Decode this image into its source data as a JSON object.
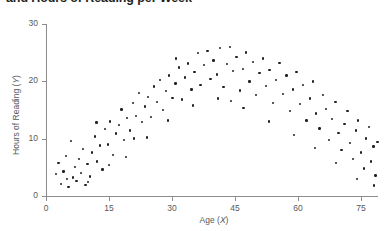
{
  "chart_data": {
    "type": "scatter",
    "title": "and Hours of Reading per Week",
    "xlabel": "Age (X)",
    "ylabel": "Hours of Reading (Y)",
    "xlim": [
      0,
      79
    ],
    "ylim": [
      0,
      30
    ],
    "xticks": [
      0,
      15,
      30,
      45,
      60,
      75
    ],
    "yticks": [
      0,
      10,
      20,
      30
    ],
    "xtick_labels": [
      "0",
      "15",
      "30",
      "45",
      "60",
      "75"
    ],
    "ytick_labels": [
      "0",
      "10",
      "20",
      "30"
    ],
    "grid": false,
    "legend": null,
    "marker_color": "#231f20",
    "axis_color": "#8c8c8c",
    "relationship": "inverted-U quadratic: reading hours rise with age to a peak near age 38-42 then decline",
    "points": [
      [
        3.0,
        5.8
      ],
      [
        3.6,
        2.1
      ],
      [
        4.2,
        4.3
      ],
      [
        4.8,
        7.0
      ],
      [
        5.4,
        1.6
      ],
      [
        6.0,
        9.6
      ],
      [
        6.4,
        3.2
      ],
      [
        6.9,
        5.1
      ],
      [
        7.3,
        2.6
      ],
      [
        7.8,
        6.4
      ],
      [
        8.3,
        4.0
      ],
      [
        8.8,
        8.2
      ],
      [
        9.4,
        1.9
      ],
      [
        9.9,
        5.6
      ],
      [
        10.4,
        3.4
      ],
      [
        11.0,
        7.6
      ],
      [
        11.6,
        10.4
      ],
      [
        12.2,
        6.0
      ],
      [
        12.8,
        8.8
      ],
      [
        13.4,
        4.6
      ],
      [
        14.0,
        11.7
      ],
      [
        14.7,
        9.0
      ],
      [
        15.3,
        13.0
      ],
      [
        16.0,
        7.2
      ],
      [
        16.6,
        10.9
      ],
      [
        17.3,
        12.4
      ],
      [
        18.0,
        15.1
      ],
      [
        18.6,
        9.8
      ],
      [
        19.3,
        13.6
      ],
      [
        20.0,
        11.4
      ],
      [
        20.7,
        16.2
      ],
      [
        21.4,
        14.0
      ],
      [
        22.1,
        18.0
      ],
      [
        22.8,
        12.9
      ],
      [
        23.5,
        15.6
      ],
      [
        24.2,
        17.3
      ],
      [
        25.0,
        13.8
      ],
      [
        25.7,
        19.1
      ],
      [
        26.4,
        16.4
      ],
      [
        27.1,
        20.2
      ],
      [
        27.9,
        15.0
      ],
      [
        28.6,
        18.3
      ],
      [
        29.3,
        21.0
      ],
      [
        30.1,
        17.1
      ],
      [
        30.8,
        19.6
      ],
      [
        31.6,
        22.4
      ],
      [
        32.3,
        16.8
      ],
      [
        33.1,
        20.7
      ],
      [
        33.8,
        23.1
      ],
      [
        34.6,
        18.6
      ],
      [
        35.3,
        21.6
      ],
      [
        36.1,
        24.9
      ],
      [
        36.8,
        19.4
      ],
      [
        37.6,
        22.8
      ],
      [
        38.4,
        25.3
      ],
      [
        39.1,
        20.4
      ],
      [
        39.9,
        23.6
      ],
      [
        40.7,
        21.2
      ],
      [
        41.4,
        25.8
      ],
      [
        42.2,
        19.0
      ],
      [
        43.0,
        23.0
      ],
      [
        43.8,
        26.0
      ],
      [
        44.5,
        21.8
      ],
      [
        45.3,
        24.2
      ],
      [
        46.1,
        18.4
      ],
      [
        46.9,
        22.2
      ],
      [
        47.6,
        25.0
      ],
      [
        48.4,
        20.0
      ],
      [
        49.2,
        23.4
      ],
      [
        50.0,
        17.6
      ],
      [
        50.8,
        21.4
      ],
      [
        51.6,
        24.0
      ],
      [
        52.4,
        19.2
      ],
      [
        53.2,
        22.0
      ],
      [
        54.0,
        16.2
      ],
      [
        54.8,
        20.2
      ],
      [
        55.6,
        23.2
      ],
      [
        56.4,
        17.8
      ],
      [
        57.2,
        21.0
      ],
      [
        58.0,
        14.8
      ],
      [
        58.8,
        18.6
      ],
      [
        59.6,
        21.6
      ],
      [
        60.4,
        16.0
      ],
      [
        61.2,
        19.4
      ],
      [
        62.0,
        13.2
      ],
      [
        62.8,
        17.0
      ],
      [
        63.5,
        20.0
      ],
      [
        64.3,
        14.4
      ],
      [
        65.1,
        11.8
      ],
      [
        65.9,
        17.6
      ],
      [
        66.6,
        15.2
      ],
      [
        67.4,
        9.8
      ],
      [
        68.1,
        13.4
      ],
      [
        68.9,
        16.4
      ],
      [
        69.6,
        11.0
      ],
      [
        70.3,
        8.0
      ],
      [
        71.0,
        12.6
      ],
      [
        71.7,
        14.8
      ],
      [
        72.4,
        9.2
      ],
      [
        73.0,
        6.4
      ],
      [
        73.7,
        11.4
      ],
      [
        74.3,
        13.2
      ],
      [
        75.0,
        7.6
      ],
      [
        75.6,
        4.8
      ],
      [
        76.2,
        10.0
      ],
      [
        76.8,
        12.0
      ],
      [
        77.3,
        6.0
      ],
      [
        77.9,
        8.6
      ],
      [
        78.4,
        3.6
      ],
      [
        78.9,
        9.4
      ],
      [
        5.0,
        3.0
      ],
      [
        10.0,
        2.4
      ],
      [
        15.0,
        5.4
      ],
      [
        19.0,
        6.8
      ],
      [
        24.0,
        10.2
      ],
      [
        29.0,
        13.2
      ],
      [
        35.0,
        15.8
      ],
      [
        41.0,
        17.0
      ],
      [
        47.0,
        15.4
      ],
      [
        53.0,
        13.0
      ],
      [
        59.0,
        10.6
      ],
      [
        64.0,
        8.4
      ],
      [
        69.0,
        5.8
      ],
      [
        74.0,
        3.0
      ],
      [
        78.0,
        1.8
      ],
      [
        2.4,
        3.8
      ],
      [
        12.0,
        12.8
      ],
      [
        21.0,
        10.0
      ],
      [
        31.0,
        24.0
      ],
      [
        44.0,
        16.6
      ]
    ]
  }
}
